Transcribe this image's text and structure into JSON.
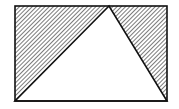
{
  "diagram": {
    "title": "",
    "width": 179,
    "height": 109,
    "colors": {
      "stroke": "#111111",
      "hatch": "#333333",
      "background": "#ffffff",
      "triangle_fill": "#ffffff"
    },
    "rectangle": {
      "x": 15,
      "y": 6,
      "width": 152,
      "height": 95
    },
    "triangle": {
      "points": [
        [
          15,
          101
        ],
        [
          109,
          6
        ],
        [
          167,
          101
        ]
      ]
    },
    "shaded_regions": [
      {
        "name": "left-region",
        "points": [
          [
            15,
            6
          ],
          [
            109,
            6
          ],
          [
            15,
            101
          ]
        ]
      },
      {
        "name": "right-region",
        "points": [
          [
            109,
            6
          ],
          [
            167,
            6
          ],
          [
            167,
            101
          ]
        ]
      }
    ],
    "hatch": {
      "spacing": 3,
      "angle": 45
    }
  }
}
